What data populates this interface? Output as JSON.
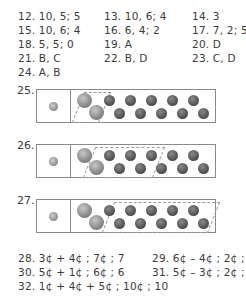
{
  "answers_top": [
    {
      "id": "12",
      "text": "12. 10, 5; 5",
      "x": 18,
      "y": 15
    },
    {
      "id": "13",
      "text": "13. 10, 6; 4",
      "x": 104,
      "y": 15
    },
    {
      "id": "14",
      "text": "14. 3",
      "x": 192,
      "y": 15
    },
    {
      "id": "15",
      "text": "15. 10, 6; 4",
      "x": 18,
      "y": 29
    },
    {
      "id": "16",
      "text": "16. 6, 4; 2",
      "x": 104,
      "y": 29
    },
    {
      "id": "17",
      "text": "17. 7, 2; 5",
      "x": 192,
      "y": 29
    },
    {
      "id": "18",
      "text": "18. 5, 5; 0",
      "x": 18,
      "y": 43
    },
    {
      "id": "19",
      "text": "19. A",
      "x": 104,
      "y": 43
    },
    {
      "id": "20",
      "text": "20. D",
      "x": 192,
      "y": 43
    },
    {
      "id": "21",
      "text": "21. B, C",
      "x": 18,
      "y": 57
    },
    {
      "id": "22",
      "text": "22. B, D",
      "x": 104,
      "y": 57
    },
    {
      "id": "23",
      "text": "23. C, D",
      "x": 192,
      "y": 57
    },
    {
      "id": "24",
      "text": "24. A, B",
      "x": 18,
      "y": 71
    }
  ],
  "coin_problems": [
    {
      "number": "25.",
      "top": 89,
      "circled": "2 nickels"
    },
    {
      "number": "26.",
      "top": 144,
      "circled": "1 nickel + 6 pennies"
    },
    {
      "number": "27.",
      "top": 199,
      "circled": "10 pennies"
    }
  ],
  "answers_bottom": [
    {
      "id": "28",
      "text": "28. 3¢ + 4¢ ; 7¢ ; 7",
      "x": 18,
      "y": 257
    },
    {
      "id": "29",
      "text": "29. 6¢ – 4¢ ; 2¢ ; 2",
      "x": 152,
      "y": 257
    },
    {
      "id": "30",
      "text": "30. 5¢ + 1¢ ; 6¢ ; 6",
      "x": 18,
      "y": 271
    },
    {
      "id": "31",
      "text": "31. 5¢ – 3¢ ; 2¢ ; 2",
      "x": 152,
      "y": 271
    },
    {
      "id": "32",
      "text": "32. 1¢ + 4¢ + 5¢ ; 10¢ ; 10",
      "x": 18,
      "y": 285
    }
  ]
}
